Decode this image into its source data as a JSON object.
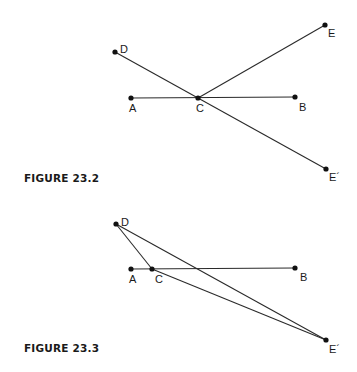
{
  "figures": [
    {
      "caption": "FIGURE 23.2",
      "points": {
        "D": {
          "label": "D"
        },
        "A": {
          "label": "A"
        },
        "C": {
          "label": "C"
        },
        "B": {
          "label": "B"
        },
        "E": {
          "label": "E"
        },
        "E2": {
          "label": "E´"
        }
      },
      "segments": [
        [
          "A",
          "B"
        ],
        [
          "D",
          "E2"
        ],
        [
          "C",
          "E"
        ]
      ]
    },
    {
      "caption": "FIGURE 23.3",
      "points": {
        "D": {
          "label": "D"
        },
        "A": {
          "label": "A"
        },
        "C": {
          "label": "C"
        },
        "B": {
          "label": "B"
        },
        "E2": {
          "label": "E´"
        }
      },
      "segments": [
        [
          "A",
          "B"
        ],
        [
          "D",
          "C"
        ],
        [
          "D",
          "E2"
        ],
        [
          "C",
          "E2"
        ]
      ]
    }
  ]
}
